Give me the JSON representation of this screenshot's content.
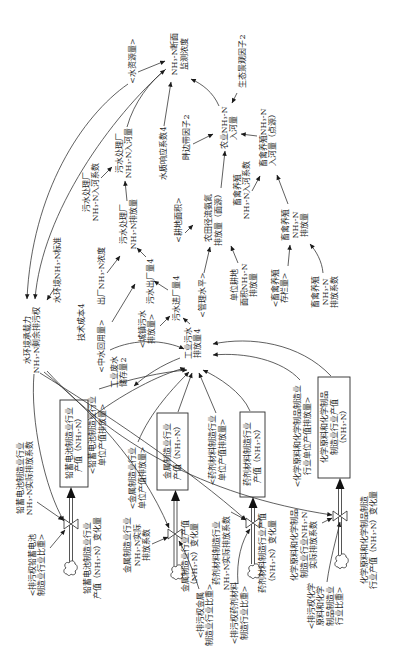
{
  "colors": {
    "background": "#ffffff",
    "line": "#2b2b2b",
    "text": "#1e1e1e"
  },
  "nodes": {
    "nh3_section_concentration": {
      "type": "auxiliary",
      "lines": [
        "NH₃-N断面",
        "监测浓度"
      ]
    },
    "water_resources": {
      "type": "shadow",
      "lines": [
        "<水资源量>"
      ]
    },
    "eco_landscape_factor": {
      "type": "auxiliary",
      "lines": [
        "生态景观因子2"
      ]
    },
    "agri_nh3_to_river": {
      "type": "auxiliary",
      "lines": [
        "农业NH₃-N",
        "入河量"
      ]
    },
    "riparian_buffer_factor": {
      "type": "auxiliary",
      "lines": [
        "畔边带因子2"
      ]
    },
    "water_quality_response_coef": {
      "type": "auxiliary",
      "lines": [
        "水质响应系数4"
      ]
    },
    "wwtp_nh3_to_river": {
      "type": "auxiliary",
      "lines": [
        "污水处理厂",
        "NH₃-N入河量"
      ]
    },
    "wwtp_to_river_coef": {
      "type": "auxiliary",
      "lines": [
        "污水处理厂",
        "NH₃-N入河系数"
      ]
    },
    "wwtp_nh3_discharge": {
      "type": "auxiliary",
      "lines": [
        "污水处理厂",
        "NH₃-N排放量"
      ]
    },
    "arable_area": {
      "type": "shadow",
      "lines": [
        "<耕地面积>"
      ]
    },
    "farmland_runoff_discharge": {
      "type": "auxiliary",
      "lines": [
        "农田径流氨氮",
        "排放量（面源）"
      ]
    },
    "livestock_to_river_coef": {
      "type": "auxiliary",
      "lines": [
        "畜禽养殖",
        "NH₃-N入河系数"
      ]
    },
    "livestock_nh3_to_river": {
      "type": "auxiliary",
      "lines": [
        "畜禽养殖NH₃-N",
        "入河量（点源）"
      ]
    },
    "livestock_nh3_discharge": {
      "type": "auxiliary",
      "lines": [
        "畜禽养殖",
        "NH₃-N",
        "排放量"
      ]
    },
    "unit_arable_nh3_discharge": {
      "type": "auxiliary",
      "lines": [
        "单位耕地",
        "面积NH₃-N",
        "排放量"
      ]
    },
    "livestock_inventory": {
      "type": "shadow",
      "lines": [
        "<畜禽养殖",
        "存栏量>"
      ]
    },
    "livestock_discharge_coef": {
      "type": "auxiliary",
      "lines": [
        "畜禽养殖",
        "NH₃-N",
        "排放系数"
      ]
    },
    "management_level": {
      "type": "shadow",
      "lines": [
        "<管理水平>"
      ]
    },
    "sewage_outflow": {
      "type": "auxiliary",
      "lines": [
        "污水出厂量4"
      ]
    },
    "sewage_intake": {
      "type": "auxiliary",
      "lines": [
        "污水进厂量4"
      ]
    },
    "urban_sewage_discharge": {
      "type": "shadow",
      "lines": [
        "<城镇污水",
        "排放量>"
      ]
    },
    "industrial_wastewater_discharge": {
      "type": "auxiliary",
      "lines": [
        "工业污水",
        "排放量4"
      ]
    },
    "effluent_nh3_concentration": {
      "type": "auxiliary",
      "lines": [
        "出厂NH₃-N浓度"
      ]
    },
    "water_env_nh3_standard": {
      "type": "auxiliary",
      "lines": [
        "水环境NH₃-N标准"
      ]
    },
    "carrying_capacity": {
      "type": "auxiliary",
      "lines": [
        "水环境承载力",
        "NH₃-N剩余排污权"
      ]
    },
    "technology_cost": {
      "type": "auxiliary",
      "lines": [
        "技术成本4"
      ]
    },
    "reclaimed_water": {
      "type": "shadow",
      "lines": [
        "<中水回用量>"
      ]
    },
    "industrial_wastewater_storage": {
      "type": "auxiliary",
      "lines": [
        "工业废水",
        "储存量2"
      ]
    }
  },
  "industries": {
    "lead_battery": {
      "unit_output_discharge": [
        "<铅蓄电池制造业行业",
        "单位产值排放量>"
      ],
      "output_stock": [
        "铅蓄电池制造业行业",
        "产值（NH₃-N）"
      ],
      "actual_discharge_coef": [
        "铅蓄电池制造业行业",
        "NH₃-N实际排放系数"
      ],
      "output_change_flow": [
        "铅蓄电池制造业行业",
        "产值（NH₃-N）变化量"
      ],
      "permit_share": [
        "<排污权铅蓄电池",
        "制造业行业比重>"
      ]
    },
    "metal": {
      "unit_output_discharge": [
        "<金属制造业行业",
        "单位产值排放量>"
      ],
      "output_stock": [
        "金属制造业行业",
        "产值（NH₃-N）"
      ],
      "actual_discharge_coef": [
        "金属制造业行业",
        "NH₃-N实际",
        "排放系数"
      ],
      "output_change_flow": [
        "金属制造业行业产值",
        "（NH₃-N）变化量"
      ],
      "permit_share": [
        "<排污权金属",
        "制造业行业比重>"
      ]
    },
    "pharma_material": {
      "unit_output_discharge": [
        "<药剂材料制造行业",
        "单位产值排放量>"
      ],
      "output_stock": [
        "药剂材料制造行业",
        "产值（NH₃-N）"
      ],
      "actual_discharge_coef": [
        "药剂材料制造行业",
        "NH₃-N实际排放系数"
      ],
      "output_change_flow": [
        "药剂材料制造行业产值",
        "（NH₃-N）变化量"
      ],
      "permit_share": [
        "<排污权药剂材料",
        "制造行业比重>"
      ]
    },
    "chemical": {
      "unit_output_discharge": [
        "<化学原料和化学制品制造业",
        "行业单位产值排放量>"
      ],
      "output_stock": [
        "化学原料和化学制品",
        "制造业行业产值",
        "（NH₃-N）"
      ],
      "actual_discharge_coef": [
        "化学原料和化学制品",
        "制造业行业NH₃-N",
        "实际排放系数"
      ],
      "output_change_flow": [
        "化学原料和化学制品制造",
        "行业产值（NH₃-N）变化量"
      ],
      "permit_share": [
        "<排污权化学",
        "原料和化学",
        "制品制造业",
        "行业比重>"
      ]
    }
  },
  "edges": [
    {
      "from": "water_resources",
      "to": "nh3_section_concentration"
    },
    {
      "from": "water_resources",
      "to": "carrying_capacity"
    },
    {
      "from": "nh3_section_concentration",
      "to": "carrying_capacity"
    },
    {
      "from": "water_quality_response_coef",
      "to": "nh3_section_concentration"
    },
    {
      "from": "wwtp_nh3_to_river",
      "to": "nh3_section_concentration"
    },
    {
      "from": "agri_nh3_to_river",
      "to": "nh3_section_concentration"
    },
    {
      "from": "eco_landscape_factor",
      "to": "agri_nh3_to_river"
    },
    {
      "from": "riparian_buffer_factor",
      "to": "agri_nh3_to_river"
    },
    {
      "from": "farmland_runoff_discharge",
      "to": "agri_nh3_to_river"
    },
    {
      "from": "livestock_nh3_to_river",
      "to": "agri_nh3_to_river"
    },
    {
      "from": "livestock_to_river_coef",
      "to": "livestock_nh3_to_river"
    },
    {
      "from": "livestock_nh3_discharge",
      "to": "livestock_nh3_to_river"
    },
    {
      "from": "livestock_inventory",
      "to": "livestock_nh3_discharge"
    },
    {
      "from": "livestock_discharge_coef",
      "to": "livestock_nh3_discharge"
    },
    {
      "from": "arable_area",
      "to": "farmland_runoff_discharge"
    },
    {
      "from": "management_level",
      "to": "farmland_runoff_discharge"
    },
    {
      "from": "unit_arable_nh3_discharge",
      "to": "farmland_runoff_discharge"
    },
    {
      "from": "wwtp_to_river_coef",
      "to": "wwtp_nh3_to_river"
    },
    {
      "from": "wwtp_nh3_discharge",
      "to": "wwtp_nh3_to_river"
    },
    {
      "from": "effluent_nh3_concentration",
      "to": "wwtp_nh3_discharge"
    },
    {
      "from": "sewage_outflow",
      "to": "wwtp_nh3_discharge"
    },
    {
      "from": "reclaimed_water",
      "to": "sewage_outflow"
    },
    {
      "from": "sewage_intake",
      "to": "sewage_outflow"
    },
    {
      "from": "urban_sewage_discharge",
      "to": "sewage_intake"
    },
    {
      "from": "industrial_wastewater_discharge",
      "to": "sewage_intake"
    },
    {
      "from": "reclaimed_water",
      "to": "industrial_wastewater_discharge"
    },
    {
      "from": "industrial_wastewater_discharge",
      "to": "industrial_wastewater_storage"
    },
    {
      "from": "water_env_nh3_standard",
      "to": "carrying_capacity"
    },
    {
      "from": "carrying_capacity",
      "to": "industries.lead_battery.output_change_flow"
    },
    {
      "from": "carrying_capacity",
      "to": "industries.metal.output_change_flow"
    },
    {
      "from": "carrying_capacity",
      "to": "industries.pharma_material.output_change_flow"
    },
    {
      "from": "carrying_capacity",
      "to": "industries.chemical.output_change_flow"
    },
    {
      "from": "industries.lead_battery.output_stock",
      "to": "industrial_wastewater_discharge"
    },
    {
      "from": "industries.lead_battery.unit_output_discharge",
      "to": "industrial_wastewater_discharge"
    },
    {
      "from": "industries.metal.unit_output_discharge",
      "to": "industrial_wastewater_discharge"
    },
    {
      "from": "industries.metal.output_stock",
      "to": "industrial_wastewater_discharge"
    },
    {
      "from": "industries.pharma_material.unit_output_discharge",
      "to": "industrial_wastewater_discharge"
    },
    {
      "from": "industries.pharma_material.output_stock",
      "to": "industrial_wastewater_discharge"
    },
    {
      "from": "industries.chemical.unit_output_discharge",
      "to": "industrial_wastewater_discharge"
    },
    {
      "from": "industries.chemical.output_stock",
      "to": "industrial_wastewater_discharge"
    },
    {
      "from": "industries.lead_battery.actual_discharge_coef",
      "to": "industries.lead_battery.output_change_flow"
    },
    {
      "from": "industries.metal.actual_discharge_coef",
      "to": "industries.metal.output_change_flow"
    },
    {
      "from": "industries.pharma_material.actual_discharge_coef",
      "to": "industries.pharma_material.output_change_flow"
    },
    {
      "from": "industries.chemical.actual_discharge_coef",
      "to": "industries.chemical.output_change_flow"
    },
    {
      "from": "industries.lead_battery.permit_share",
      "to": "industries.lead_battery.output_change_flow"
    },
    {
      "from": "industries.metal.permit_share",
      "to": "industries.metal.output_change_flow"
    },
    {
      "from": "industries.pharma_material.permit_share",
      "to": "industries.pharma_material.output_change_flow"
    },
    {
      "from": "industries.chemical.permit_share",
      "to": "industries.chemical.output_change_flow"
    },
    {
      "from": "industries.lead_battery.output_change_flow",
      "to": "industries.lead_battery.output_stock",
      "kind": "flow"
    },
    {
      "from": "industries.metal.output_change_flow",
      "to": "industries.metal.output_stock",
      "kind": "flow"
    },
    {
      "from": "industries.pharma_material.output_change_flow",
      "to": "industries.pharma_material.output_stock",
      "kind": "flow"
    },
    {
      "from": "industries.chemical.output_change_flow",
      "to": "industries.chemical.output_stock",
      "kind": "flow"
    }
  ]
}
